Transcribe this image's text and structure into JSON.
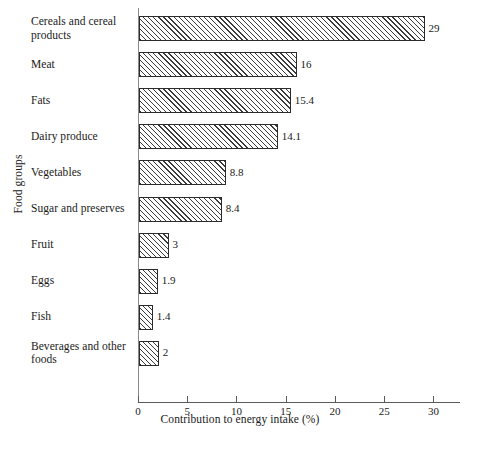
{
  "chart_data": {
    "type": "bar",
    "orientation": "horizontal",
    "title": "",
    "xlabel": "Contribution to energy intake (%)",
    "ylabel": "Food groups",
    "categories": [
      "Cereals and cereal products",
      "Meat",
      "Fats",
      "Dairy produce",
      "Vegetables",
      "Sugar and preserves",
      "Fruit",
      "Eggs",
      "Fish",
      "Beverages and other foods"
    ],
    "values": [
      29,
      16,
      15.4,
      14.1,
      8.8,
      8.4,
      3,
      1.9,
      1.4,
      2
    ],
    "value_labels": [
      "29",
      "16",
      "15.4",
      "14.1",
      "8.8",
      "8.4",
      "3",
      "1.9",
      "1.4",
      "2"
    ],
    "xlim": [
      0,
      32.7
    ],
    "xticks": [
      0,
      5,
      10,
      15,
      20,
      25,
      30
    ],
    "xtick_labels": [
      "0",
      "5",
      "10",
      "15",
      "20",
      "25",
      "30"
    ],
    "grid": false,
    "legend": false,
    "bar_fill": "hatched-diagonal",
    "bar_edge_color": "#2b2b2b",
    "hatch_color": "#3a3a3a",
    "background_color": "#ffffff"
  }
}
